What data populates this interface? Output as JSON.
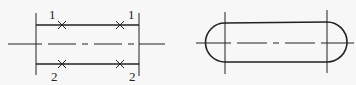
{
  "figures": {
    "left": {
      "description": "Two parallel lines with end boundaries, dashed center line, cross marks",
      "labels": [
        {
          "id": "top-left",
          "text": "1"
        },
        {
          "id": "top-right",
          "text": "1"
        },
        {
          "id": "bottom-left",
          "text": "2"
        },
        {
          "id": "bottom-right",
          "text": "2"
        }
      ]
    },
    "right": {
      "description": "Rounded slot (obround) with dashed center line and two vertical boundary lines"
    }
  },
  "colors": {
    "line": "#222222",
    "background": "#f7f7f7"
  }
}
